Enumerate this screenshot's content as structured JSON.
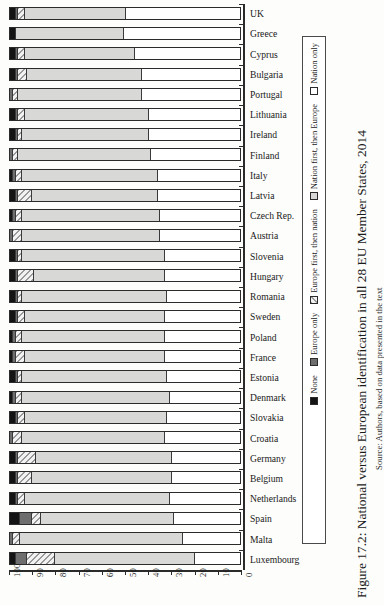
{
  "caption": "Figure 17.2: National versus European identification in all 28 EU Member States, 2014",
  "source": "Source: Authors, based on data presented in the text",
  "legend": {
    "items": [
      {
        "label": "Nation only",
        "key": "nation-only",
        "color": "#ffffff"
      },
      {
        "label": "Nation first, then Europe",
        "key": "nation-first",
        "color": "#d8d8d6"
      },
      {
        "label": "Europe first, then nation",
        "key": "europe-first",
        "color": "#f2f2f2"
      },
      {
        "label": "Europe only",
        "key": "europe-only",
        "color": "#6e6e6e"
      },
      {
        "label": "None",
        "key": "none",
        "color": "#141414"
      }
    ]
  },
  "chart_data": {
    "type": "bar",
    "orientation": "horizontal-stacked",
    "title": "Figure 17.2: National versus European identification in all 28 EU Member States, 2014",
    "xlabel": "",
    "ylabel": "",
    "xlim": [
      100,
      0
    ],
    "x_ticks": [
      100,
      90,
      80,
      70,
      60,
      50,
      40,
      30,
      20,
      10,
      0
    ],
    "grid": false,
    "legend_position": "right",
    "stack_order_from_left": [
      "None",
      "Europe only",
      "Europe first, then nation",
      "Nation first, then Europe",
      "Nation only"
    ],
    "categories": [
      "UK",
      "Greece",
      "Cyprus",
      "Bulgaria",
      "Portugal",
      "Lithuania",
      "Ireland",
      "Finland",
      "Italy",
      "Latvia",
      "Czech Rep.",
      "Austria",
      "Slovenia",
      "Hungary",
      "Romania",
      "Sweden",
      "Poland",
      "France",
      "Estonia",
      "Denmark",
      "Slovakia",
      "Croatia",
      "Germany",
      "Belgium",
      "Netherlands",
      "Spain",
      "Malta",
      "Luxembourg"
    ],
    "series": [
      {
        "name": "None",
        "values": [
          2,
          2,
          2,
          2,
          0,
          2,
          2,
          0,
          1,
          2,
          1,
          0,
          2,
          2,
          2,
          2,
          1,
          1,
          2,
          1,
          2,
          0,
          2,
          2,
          2,
          4,
          0,
          2
        ]
      },
      {
        "name": "Europe only",
        "values": [
          1,
          0,
          1,
          1,
          1,
          1,
          1,
          1,
          1,
          1,
          1,
          1,
          1,
          1,
          1,
          1,
          1,
          1,
          1,
          1,
          1,
          1,
          1,
          1,
          1,
          5,
          1,
          5
        ]
      },
      {
        "name": "Europe first, then nation",
        "values": [
          3,
          0,
          3,
          4,
          2,
          3,
          2,
          2,
          3,
          6,
          3,
          4,
          2,
          7,
          2,
          3,
          3,
          4,
          2,
          3,
          3,
          4,
          8,
          6,
          3,
          4,
          3,
          12
        ]
      },
      {
        "name": "Nation first, then Europe",
        "values": [
          44,
          47,
          48,
          50,
          54,
          54,
          55,
          58,
          59,
          55,
          60,
          60,
          62,
          57,
          63,
          61,
          62,
          61,
          63,
          64,
          62,
          62,
          59,
          61,
          63,
          58,
          71,
          61
        ]
      },
      {
        "name": "Nation only",
        "values": [
          50,
          51,
          46,
          43,
          43,
          40,
          40,
          39,
          36,
          36,
          35,
          35,
          33,
          33,
          32,
          33,
          33,
          33,
          32,
          31,
          32,
          33,
          30,
          30,
          31,
          29,
          25,
          20
        ]
      }
    ]
  }
}
